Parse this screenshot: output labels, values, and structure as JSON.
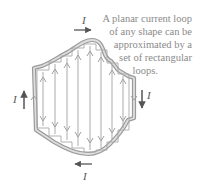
{
  "caption": {
    "lines": [
      "A planar current loop",
      "of any shape can be",
      "approximated by a",
      "set of rectangular",
      "loops."
    ]
  },
  "current_labels": {
    "top": "I",
    "left": "I",
    "right": "I",
    "bottom": "I"
  },
  "colors": {
    "outline": "#9a9a9a",
    "outline_fill": "#cfcfcf",
    "rect_lines": "#a8a8a8",
    "arrows": "#555555",
    "caption_text": "#8a8a8a"
  },
  "icons": {
    "top_arrow": "arrow-right-icon",
    "left_arrow": "arrow-up-icon",
    "right_arrow": "arrow-down-icon",
    "bottom_arrow": "arrow-left-icon"
  }
}
